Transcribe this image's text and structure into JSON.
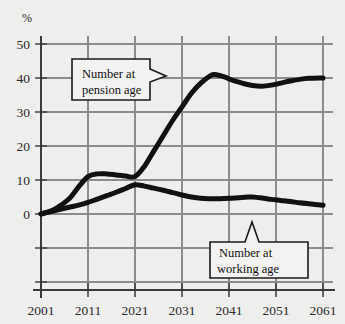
{
  "chart_data": {
    "type": "line",
    "title": "",
    "subtitle": "",
    "xlabel": "",
    "ylabel": "%",
    "ylabel_note": "percent",
    "xlim": [
      2001,
      2061
    ],
    "ylim": [
      -20,
      55
    ],
    "yticks": [
      50,
      40,
      30,
      20,
      10,
      0
    ],
    "ytick_labels": [
      "50",
      "40",
      "30",
      "20",
      "10",
      "0"
    ],
    "y_unlabeled_gridlines": [
      -10,
      -20
    ],
    "xticks": [
      2001,
      2011,
      2021,
      2031,
      2041,
      2051,
      2061
    ],
    "xtick_labels": [
      "2001",
      "2011",
      "2021",
      "2031",
      "2041",
      "2051",
      "2061"
    ],
    "grid": true,
    "legend": "none",
    "annotations": [
      {
        "name": "pension-callout",
        "line1": "Number at",
        "line2": "pension age",
        "pointer": "right",
        "target_series": "Number at pension age"
      },
      {
        "name": "working-callout",
        "line1": "Number at",
        "line2": "working age",
        "pointer": "top",
        "target_series": "Number at working age"
      }
    ],
    "series": [
      {
        "name": "Number at pension age",
        "color": "#111111",
        "x": [
          2001,
          2004,
          2007,
          2009,
          2011,
          2013,
          2015,
          2017,
          2019,
          2021,
          2023,
          2025,
          2027,
          2029,
          2031,
          2033,
          2035,
          2037,
          2038,
          2040,
          2042,
          2044,
          2046,
          2048,
          2050,
          2052,
          2054,
          2056,
          2058,
          2061
        ],
        "values": [
          0,
          1.5,
          4.5,
          8.0,
          11.0,
          11.8,
          11.8,
          11.5,
          11.2,
          11.0,
          14.0,
          18.5,
          23.0,
          27.5,
          31.5,
          35.5,
          38.5,
          40.6,
          41.0,
          40.3,
          39.2,
          38.4,
          37.8,
          37.6,
          37.9,
          38.5,
          39.1,
          39.6,
          39.9,
          40.0
        ]
      },
      {
        "name": "Number at working age",
        "color": "#111111",
        "x": [
          2001,
          2004,
          2007,
          2009,
          2011,
          2013,
          2015,
          2017,
          2019,
          2021,
          2023,
          2025,
          2027,
          2029,
          2031,
          2033,
          2035,
          2037,
          2039,
          2041,
          2043,
          2045,
          2046,
          2048,
          2050,
          2052,
          2054,
          2056,
          2058,
          2061
        ],
        "values": [
          0,
          1.0,
          2.0,
          2.6,
          3.4,
          4.4,
          5.4,
          6.4,
          7.5,
          8.6,
          8.2,
          7.6,
          7.0,
          6.3,
          5.6,
          5.0,
          4.6,
          4.5,
          4.5,
          4.6,
          4.8,
          5.0,
          5.0,
          4.7,
          4.3,
          4.0,
          3.7,
          3.3,
          3.0,
          2.6
        ]
      }
    ],
    "style": {
      "background": "#eeeeec",
      "grid_color": "#8c8c8c",
      "axis_color": "#3a3a3a",
      "line_color": "#111111",
      "line_width": 5,
      "callout_fill": "#f2f2f0",
      "callout_border": "#1a1a1a"
    }
  }
}
